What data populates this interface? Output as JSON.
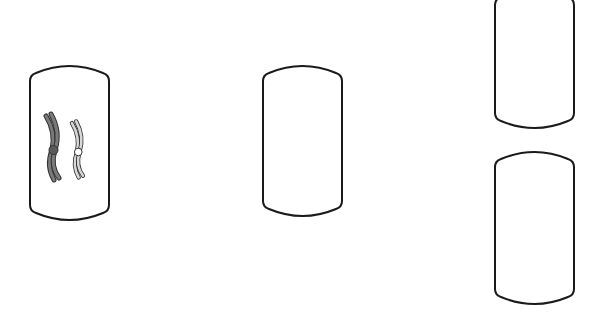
{
  "diagram": {
    "type": "cell division illustration",
    "background": "#ffffff",
    "stroke_color": "#1a1a1a",
    "cells": [
      {
        "id": "parent-cell",
        "x": 30,
        "y": 66,
        "width": 79,
        "height": 154,
        "contents": [
          {
            "type": "chromosome",
            "shade": "dark",
            "fill": "#7a7a7a",
            "centromere": "#5a5a5a",
            "x": 52,
            "y": 150
          },
          {
            "type": "chromosome",
            "shade": "light",
            "fill": "#d8d8d8",
            "centromere": "#ffffff",
            "x": 77,
            "y": 152
          }
        ]
      },
      {
        "id": "middle-cell",
        "x": 263,
        "y": 66,
        "width": 79,
        "height": 150,
        "contents": []
      },
      {
        "id": "daughter-cell-top",
        "x": 495,
        "y": -10,
        "width": 79,
        "height": 138,
        "contents": []
      },
      {
        "id": "daughter-cell-bottom",
        "x": 495,
        "y": 152,
        "width": 79,
        "height": 152,
        "contents": []
      }
    ]
  }
}
